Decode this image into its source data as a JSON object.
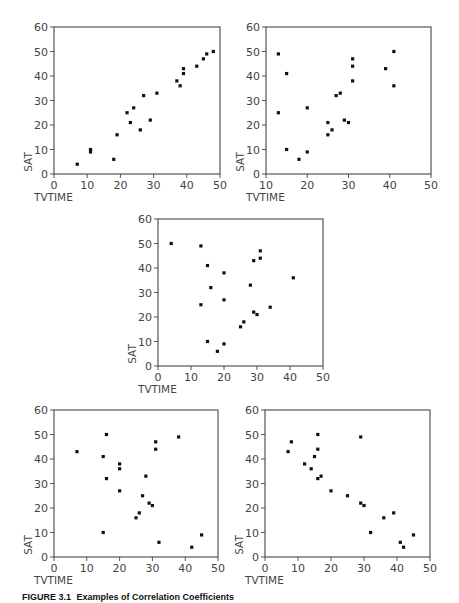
{
  "figure": {
    "caption_number": "FIGURE 3.1",
    "caption_text": "Examples of Correlation Coefficients"
  },
  "style": {
    "axis_color": "#555555",
    "point_color": "#111111",
    "label_color": "#444444"
  },
  "chart_data": [
    {
      "type": "scatter",
      "id": "plot-1",
      "title": "",
      "xlabel": "TVTIME",
      "ylabel": "SAT",
      "xlim": [
        0,
        50
      ],
      "ylim": [
        0,
        60
      ],
      "xticks": [
        0,
        10,
        20,
        30,
        40,
        50
      ],
      "yticks": [
        0,
        10,
        20,
        30,
        40,
        50,
        60
      ],
      "grid": false,
      "frame": {
        "left": 54,
        "top": 27,
        "right": 220,
        "bottom": 174
      },
      "points": [
        [
          7,
          4
        ],
        [
          11,
          10
        ],
        [
          11,
          9
        ],
        [
          18,
          6
        ],
        [
          19,
          16
        ],
        [
          22,
          25
        ],
        [
          23,
          21
        ],
        [
          24,
          27
        ],
        [
          26,
          18
        ],
        [
          27,
          32
        ],
        [
          29,
          22
        ],
        [
          31,
          33
        ],
        [
          37,
          38
        ],
        [
          38,
          36
        ],
        [
          39,
          41
        ],
        [
          39,
          43
        ],
        [
          43,
          44
        ],
        [
          45,
          47
        ],
        [
          46,
          49
        ],
        [
          48,
          50
        ]
      ]
    },
    {
      "type": "scatter",
      "id": "plot-2",
      "title": "",
      "xlabel": "TVTIME",
      "ylabel": "SAT",
      "xlim": [
        10,
        50
      ],
      "ylim": [
        0,
        60
      ],
      "xticks": [
        10,
        20,
        30,
        40,
        50
      ],
      "yticks": [
        0,
        10,
        20,
        30,
        40,
        50,
        60
      ],
      "grid": false,
      "frame": {
        "left": 266,
        "top": 27,
        "right": 431,
        "bottom": 174
      },
      "points": [
        [
          13,
          49
        ],
        [
          13,
          25
        ],
        [
          15,
          41
        ],
        [
          15,
          10
        ],
        [
          18,
          6
        ],
        [
          20,
          27
        ],
        [
          20,
          9
        ],
        [
          25,
          21
        ],
        [
          25,
          16
        ],
        [
          26,
          18
        ],
        [
          27,
          32
        ],
        [
          28,
          33
        ],
        [
          29,
          22
        ],
        [
          30,
          21
        ],
        [
          31,
          47
        ],
        [
          31,
          44
        ],
        [
          31,
          38
        ],
        [
          39,
          43
        ],
        [
          41,
          50
        ],
        [
          41,
          36
        ]
      ]
    },
    {
      "type": "scatter",
      "id": "plot-3",
      "title": "",
      "xlabel": "TVTIME",
      "ylabel": "SAT",
      "xlim": [
        0,
        50
      ],
      "ylim": [
        0,
        60
      ],
      "xticks": [
        0,
        10,
        20,
        30,
        40,
        50
      ],
      "yticks": [
        0,
        10,
        20,
        30,
        40,
        50,
        60
      ],
      "grid": false,
      "frame": {
        "left": 158,
        "top": 219,
        "right": 323,
        "bottom": 366
      },
      "points": [
        [
          4,
          50
        ],
        [
          13,
          49
        ],
        [
          13,
          25
        ],
        [
          15,
          41
        ],
        [
          15,
          10
        ],
        [
          16,
          32
        ],
        [
          18,
          6
        ],
        [
          20,
          38
        ],
        [
          20,
          27
        ],
        [
          20,
          9
        ],
        [
          25,
          16
        ],
        [
          26,
          18
        ],
        [
          28,
          33
        ],
        [
          29,
          43
        ],
        [
          29,
          22
        ],
        [
          30,
          21
        ],
        [
          31,
          47
        ],
        [
          31,
          44
        ],
        [
          34,
          24
        ],
        [
          41,
          36
        ]
      ]
    },
    {
      "type": "scatter",
      "id": "plot-4",
      "title": "",
      "xlabel": "TVTIME",
      "ylabel": "SAT",
      "xlim": [
        0,
        50
      ],
      "ylim": [
        0,
        60
      ],
      "xticks": [
        0,
        10,
        20,
        30,
        40,
        50
      ],
      "yticks": [
        0,
        10,
        20,
        30,
        40,
        50,
        60
      ],
      "grid": false,
      "frame": {
        "left": 54,
        "top": 410,
        "right": 218,
        "bottom": 557
      },
      "points": [
        [
          7,
          43
        ],
        [
          15,
          41
        ],
        [
          15,
          10
        ],
        [
          16,
          50
        ],
        [
          16,
          32
        ],
        [
          20,
          38
        ],
        [
          20,
          36
        ],
        [
          20,
          27
        ],
        [
          25,
          16
        ],
        [
          26,
          18
        ],
        [
          27,
          25
        ],
        [
          28,
          33
        ],
        [
          29,
          22
        ],
        [
          30,
          21
        ],
        [
          31,
          47
        ],
        [
          31,
          44
        ],
        [
          32,
          6
        ],
        [
          38,
          49
        ],
        [
          42,
          4
        ],
        [
          45,
          9
        ]
      ]
    },
    {
      "type": "scatter",
      "id": "plot-5",
      "title": "",
      "xlabel": "TVTIME",
      "ylabel": "SAT",
      "xlim": [
        0,
        50
      ],
      "ylim": [
        0,
        60
      ],
      "xticks": [
        0,
        10,
        20,
        30,
        40,
        50
      ],
      "yticks": [
        0,
        10,
        20,
        30,
        40,
        50,
        60
      ],
      "grid": false,
      "frame": {
        "left": 265,
        "top": 410,
        "right": 430,
        "bottom": 557
      },
      "points": [
        [
          7,
          43
        ],
        [
          8,
          47
        ],
        [
          12,
          38
        ],
        [
          14,
          36
        ],
        [
          15,
          41
        ],
        [
          16,
          50
        ],
        [
          16,
          44
        ],
        [
          16,
          32
        ],
        [
          17,
          33
        ],
        [
          20,
          27
        ],
        [
          25,
          25
        ],
        [
          29,
          49
        ],
        [
          29,
          22
        ],
        [
          30,
          21
        ],
        [
          32,
          10
        ],
        [
          36,
          16
        ],
        [
          39,
          18
        ],
        [
          41,
          6
        ],
        [
          42,
          4
        ],
        [
          45,
          9
        ]
      ]
    }
  ]
}
